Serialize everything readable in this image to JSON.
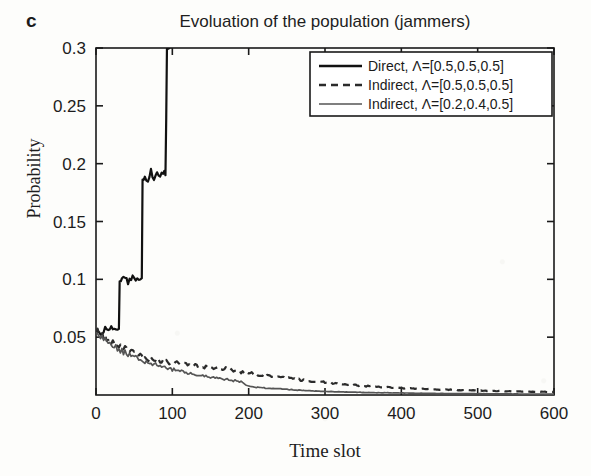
{
  "panel": {
    "label": "c"
  },
  "chart_data": {
    "type": "line",
    "title": "Evoluation of the population (jammers)",
    "xlabel": "Time slot",
    "ylabel": "Probability",
    "xlim": [
      0,
      600
    ],
    "ylim": [
      0,
      0.3
    ],
    "grid": false,
    "legend_position": "top-right",
    "xticks": [
      0,
      100,
      200,
      300,
      400,
      500,
      600
    ],
    "xtick_labels": [
      "0",
      "100",
      "200",
      "300",
      "400",
      "500",
      "600"
    ],
    "yticks": [
      0.05,
      0.1,
      0.15,
      0.2,
      0.25,
      0.3
    ],
    "ytick_labels": [
      "0.05",
      "0.1",
      "0.15",
      "0.2",
      "0.25",
      "0.3"
    ],
    "series": [
      {
        "name": "Direct, Λ=[0.5,0.5,0.5]",
        "style": "solid",
        "color": "#111111",
        "width": 2.2,
        "x": [
          0,
          4,
          8,
          12,
          16,
          20,
          24,
          28,
          30,
          31,
          34,
          38,
          42,
          46,
          50,
          54,
          58,
          60,
          61,
          64,
          68,
          72,
          76,
          80,
          84,
          88,
          91,
          92,
          93,
          95,
          100
        ],
        "y": [
          0.052,
          0.056,
          0.053,
          0.058,
          0.055,
          0.06,
          0.056,
          0.058,
          0.057,
          0.097,
          0.1,
          0.103,
          0.099,
          0.102,
          0.098,
          0.103,
          0.1,
          0.101,
          0.183,
          0.19,
          0.186,
          0.193,
          0.188,
          0.192,
          0.187,
          0.191,
          0.19,
          0.24,
          0.3,
          0.3,
          0.3
        ]
      },
      {
        "name": "Indirect, Λ=[0.5,0.5,0.5]",
        "style": "dashed",
        "color": "#2b2b2b",
        "width": 2.2,
        "x": [
          0,
          10,
          20,
          30,
          40,
          50,
          60,
          70,
          80,
          90,
          100,
          110,
          120,
          130,
          140,
          150,
          160,
          170,
          180,
          190,
          200,
          220,
          240,
          260,
          280,
          300,
          320,
          340,
          360,
          380,
          400,
          430,
          460,
          490,
          520,
          560,
          600
        ],
        "y": [
          0.057,
          0.05,
          0.046,
          0.042,
          0.039,
          0.036,
          0.033,
          0.031,
          0.03,
          0.029,
          0.028,
          0.027,
          0.027,
          0.025,
          0.024,
          0.024,
          0.023,
          0.023,
          0.021,
          0.02,
          0.019,
          0.017,
          0.015,
          0.014,
          0.012,
          0.011,
          0.0095,
          0.0085,
          0.0075,
          0.0068,
          0.006,
          0.0052,
          0.0046,
          0.004,
          0.0035,
          0.003,
          0.0026
        ]
      },
      {
        "name": "Indirect, Λ=[0.2,0.4,0.5]",
        "style": "solid",
        "color": "#555555",
        "width": 1.7,
        "x": [
          0,
          10,
          20,
          30,
          40,
          50,
          60,
          70,
          80,
          90,
          100,
          110,
          120,
          130,
          140,
          150,
          160,
          170,
          180,
          190,
          200,
          210,
          220,
          240,
          260,
          280,
          300,
          330,
          360,
          400,
          450,
          500,
          550,
          600
        ],
        "y": [
          0.055,
          0.048,
          0.043,
          0.039,
          0.036,
          0.033,
          0.03,
          0.028,
          0.026,
          0.024,
          0.022,
          0.021,
          0.019,
          0.018,
          0.0165,
          0.0155,
          0.0145,
          0.0135,
          0.0125,
          0.0115,
          0.0075,
          0.0068,
          0.0062,
          0.0052,
          0.0044,
          0.0037,
          0.0031,
          0.0025,
          0.0021,
          0.0017,
          0.0013,
          0.0011,
          0.0009,
          0.0008
        ]
      }
    ]
  },
  "legend": {
    "entries": [
      {
        "label": "Direct, Λ=[0.5,0.5,0.5]",
        "style": "solid",
        "color": "#111111"
      },
      {
        "label": "Indirect, Λ=[0.5,0.5,0.5]",
        "style": "dashed",
        "color": "#2b2b2b"
      },
      {
        "label": "Indirect, Λ=[0.2,0.4,0.5]",
        "style": "solid-thin",
        "color": "#555555"
      }
    ]
  }
}
